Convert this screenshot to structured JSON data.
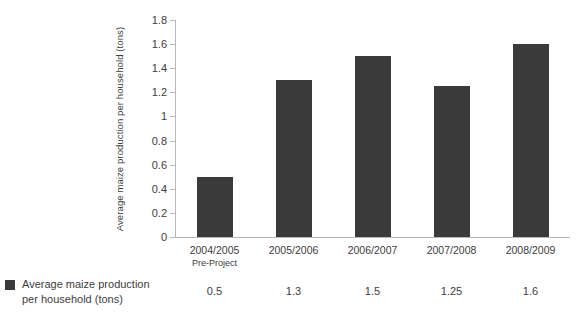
{
  "chart_data": {
    "type": "bar",
    "title": "",
    "subtitle": "",
    "xlabel": "",
    "ylabel": "Average maize production per household (tons)",
    "categories": [
      "2004/2005",
      "2005/2006",
      "2006/2007",
      "2007/2008",
      "2008/2009"
    ],
    "category_sublabels": [
      "Pre-Project",
      "",
      "",
      "",
      ""
    ],
    "values": [
      0.5,
      1.3,
      1.5,
      1.25,
      1.6
    ],
    "value_labels": [
      "0.5",
      "1.3",
      "1.5",
      "1.25",
      "1.6"
    ],
    "series": [
      {
        "name": "Average maize production per household (tons)",
        "values": [
          0.5,
          1.3,
          1.5,
          1.25,
          1.6
        ],
        "color": "#3a3a3a"
      }
    ],
    "ylim": [
      0,
      1.8
    ],
    "ytick_values": [
      0,
      0.2,
      0.4,
      0.6,
      0.8,
      1,
      1.2,
      1.4,
      1.6,
      1.8
    ],
    "ytick_labels": [
      "0",
      "0.2",
      "0.4",
      "0.6",
      "0.8",
      "1",
      "1.2",
      "1.4",
      "1.6",
      "1.8"
    ],
    "grid": false,
    "legend_position": "bottom-left",
    "legend_entries": [
      {
        "label": "Average maize production per household (tons)",
        "color": "#3a3a3a",
        "marker": "square"
      }
    ],
    "axis_color": "#b7b7b7",
    "background": "#ffffff",
    "data_table": {
      "row_header": "Average maize production per household (tons)",
      "columns": [
        "2004/2005 Pre-Project",
        "2005/2006",
        "2006/2007",
        "2007/2008",
        "2008/2009"
      ],
      "row_values": [
        "0.5",
        "1.3",
        "1.5",
        "1.25",
        "1.6"
      ]
    }
  },
  "legend": {
    "label_line1": "Average maize production",
    "label_line2": "per household (tons)"
  }
}
